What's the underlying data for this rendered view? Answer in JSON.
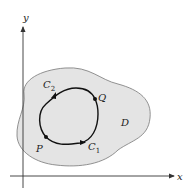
{
  "diagram": {
    "axes": {
      "x_label": "x",
      "y_label": "y"
    },
    "region_label": "D",
    "points": {
      "P": "P",
      "Q": "Q"
    },
    "curves": {
      "C1": "C",
      "C1_sub": "1",
      "C2": "C",
      "C2_sub": "2"
    },
    "colors": {
      "region_fill": "#e4e4e4",
      "region_stroke": "#777777",
      "curve": "#111111",
      "axis": "#333333"
    }
  }
}
